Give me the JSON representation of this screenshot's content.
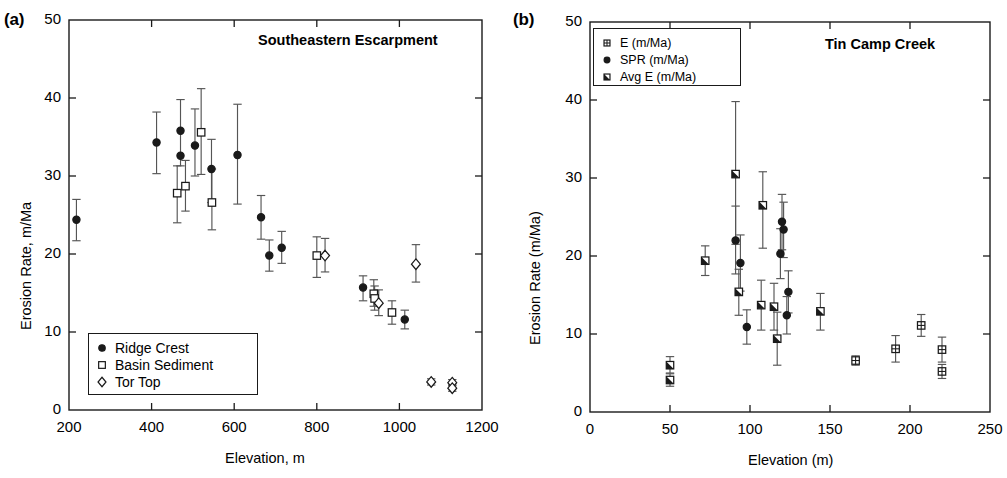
{
  "figure": {
    "background": "#ffffff",
    "ink_color": "#1a1a1a"
  },
  "panels": [
    {
      "id": "a",
      "letter": "(a)",
      "title": "Southeastern Escarpment",
      "xlabel": "Elevation, m",
      "ylabel": "Erosion Rate, m/Ma",
      "xticks": [
        "200",
        "400",
        "600",
        "800",
        "1000",
        "1200"
      ],
      "yticks": [
        "0",
        "10",
        "20",
        "30",
        "40",
        "50"
      ],
      "legend": {
        "items": [
          {
            "label": "Ridge Crest",
            "marker": "filled-circle"
          },
          {
            "label": "Basin Sediment",
            "marker": "open-square"
          },
          {
            "label": "Tor Top",
            "marker": "open-diamond"
          }
        ]
      }
    },
    {
      "id": "b",
      "letter": "(b)",
      "title": "Tin Camp Creek",
      "xlabel": "Elevation (m)",
      "ylabel": "Erosion Rate (m/Ma)",
      "xticks": [
        "0",
        "50",
        "100",
        "150",
        "200",
        "250"
      ],
      "yticks": [
        "0",
        "10",
        "20",
        "30",
        "40",
        "50"
      ],
      "legend": {
        "items": [
          {
            "label": "E (m/Ma)",
            "marker": "crossed-square"
          },
          {
            "label": "SPR (m/Ma)",
            "marker": "filled-circle"
          },
          {
            "label": "Avg E (m/Ma)",
            "marker": "half-filled-square"
          }
        ]
      }
    }
  ],
  "chart_data": [
    {
      "type": "scatter",
      "panel": "a",
      "title": "Southeastern Escarpment",
      "xlabel": "Elevation, m",
      "ylabel": "Erosion Rate, m/Ma",
      "xlim": [
        200,
        1200
      ],
      "ylim": [
        0,
        50
      ],
      "xticks": [
        200,
        400,
        600,
        800,
        1000,
        1200
      ],
      "yticks": [
        0,
        10,
        20,
        30,
        40,
        50
      ],
      "grid": false,
      "errorbars": "vertical",
      "legend_position": "lower-left",
      "series": [
        {
          "name": "Ridge Crest",
          "marker": "filled-circle",
          "points": [
            {
              "x": 218,
              "y": 24.4,
              "yerr_low": 2.7,
              "yerr_high": 2.6
            },
            {
              "x": 412,
              "y": 34.3,
              "yerr_low": 4.0,
              "yerr_high": 3.9
            },
            {
              "x": 470,
              "y": 35.8,
              "yerr_low": 4.5,
              "yerr_high": 4.0
            },
            {
              "x": 470,
              "y": 32.6,
              "yerr_low": 0.0,
              "yerr_high": 0.0
            },
            {
              "x": 505,
              "y": 33.9,
              "yerr_low": 3.9,
              "yerr_high": 4.7
            },
            {
              "x": 545,
              "y": 30.9,
              "yerr_low": 4.3,
              "yerr_high": 3.8
            },
            {
              "x": 608,
              "y": 32.7,
              "yerr_low": 6.3,
              "yerr_high": 6.5
            },
            {
              "x": 665,
              "y": 24.7,
              "yerr_low": 2.8,
              "yerr_high": 2.8
            },
            {
              "x": 685,
              "y": 19.8,
              "yerr_low": 2.0,
              "yerr_high": 2.0
            },
            {
              "x": 715,
              "y": 20.8,
              "yerr_low": 2.0,
              "yerr_high": 2.1
            },
            {
              "x": 912,
              "y": 15.7,
              "yerr_low": 1.7,
              "yerr_high": 1.5
            },
            {
              "x": 1013,
              "y": 11.6,
              "yerr_low": 1.2,
              "yerr_high": 1.2
            }
          ]
        },
        {
          "name": "Basin Sediment",
          "marker": "open-square",
          "points": [
            {
              "x": 462,
              "y": 27.8,
              "yerr_low": 3.8,
              "yerr_high": 3.5
            },
            {
              "x": 482,
              "y": 28.7,
              "yerr_low": 3.2,
              "yerr_high": 3.3
            },
            {
              "x": 520,
              "y": 35.6,
              "yerr_low": 5.4,
              "yerr_high": 5.6
            },
            {
              "x": 546,
              "y": 26.6,
              "yerr_low": 3.5,
              "yerr_high": 4.3
            },
            {
              "x": 800,
              "y": 19.8,
              "yerr_low": 2.8,
              "yerr_high": 2.4
            },
            {
              "x": 938,
              "y": 14.9,
              "yerr_low": 1.6,
              "yerr_high": 1.8
            },
            {
              "x": 940,
              "y": 14.3,
              "yerr_low": 1.5,
              "yerr_high": 1.6
            },
            {
              "x": 982,
              "y": 12.5,
              "yerr_low": 1.5,
              "yerr_high": 1.5
            }
          ]
        },
        {
          "name": "Tor Top",
          "marker": "open-diamond",
          "points": [
            {
              "x": 820,
              "y": 19.8,
              "yerr_low": 2.1,
              "yerr_high": 2.2
            },
            {
              "x": 950,
              "y": 13.7,
              "yerr_low": 1.6,
              "yerr_high": 1.7
            },
            {
              "x": 1040,
              "y": 18.7,
              "yerr_low": 2.3,
              "yerr_high": 2.5
            },
            {
              "x": 1077,
              "y": 3.6,
              "yerr_low": 0.4,
              "yerr_high": 0.4
            },
            {
              "x": 1128,
              "y": 3.5,
              "yerr_low": 0.4,
              "yerr_high": 0.4
            },
            {
              "x": 1128,
              "y": 2.8,
              "yerr_low": 0.4,
              "yerr_high": 0.4
            }
          ]
        }
      ]
    },
    {
      "type": "scatter",
      "panel": "b",
      "title": "Tin Camp Creek",
      "xlabel": "Elevation (m)",
      "ylabel": "Erosion Rate (m/Ma)",
      "xlim": [
        0,
        250
      ],
      "ylim": [
        0,
        50
      ],
      "xticks": [
        0,
        50,
        100,
        150,
        200,
        250
      ],
      "yticks": [
        0,
        10,
        20,
        30,
        40,
        50
      ],
      "grid": false,
      "errorbars": "vertical",
      "legend_position": "upper-left",
      "series": [
        {
          "name": "E (m/Ma)",
          "marker": "crossed-square",
          "points": [
            {
              "x": 166,
              "y": 6.6,
              "yerr_low": 0.6,
              "yerr_high": 0.6
            },
            {
              "x": 191,
              "y": 8.1,
              "yerr_low": 1.7,
              "yerr_high": 1.7
            },
            {
              "x": 207,
              "y": 11.1,
              "yerr_low": 1.4,
              "yerr_high": 1.4
            },
            {
              "x": 220,
              "y": 8.0,
              "yerr_low": 1.6,
              "yerr_high": 1.6
            },
            {
              "x": 220,
              "y": 5.2,
              "yerr_low": 0.9,
              "yerr_high": 0.9
            }
          ]
        },
        {
          "name": "SPR (m/Ma)",
          "marker": "filled-circle",
          "points": [
            {
              "x": 91,
              "y": 22.0,
              "yerr_low": 4.3,
              "yerr_high": 4.4
            },
            {
              "x": 94,
              "y": 19.1,
              "yerr_low": 3.6,
              "yerr_high": 3.6
            },
            {
              "x": 98,
              "y": 10.9,
              "yerr_low": 2.2,
              "yerr_high": 2.2
            },
            {
              "x": 120,
              "y": 24.4,
              "yerr_low": 3.6,
              "yerr_high": 3.5
            },
            {
              "x": 121,
              "y": 23.4,
              "yerr_low": 3.6,
              "yerr_high": 3.5
            },
            {
              "x": 119,
              "y": 20.3,
              "yerr_low": 3.2,
              "yerr_high": 3.2
            },
            {
              "x": 124,
              "y": 15.4,
              "yerr_low": 2.7,
              "yerr_high": 2.7
            },
            {
              "x": 123,
              "y": 12.4,
              "yerr_low": 2.4,
              "yerr_high": 2.4
            }
          ]
        },
        {
          "name": "Avg E (m/Ma)",
          "marker": "half-filled-square",
          "points": [
            {
              "x": 50,
              "y": 6.0,
              "yerr_low": 1.0,
              "yerr_high": 1.1
            },
            {
              "x": 50,
              "y": 4.1,
              "yerr_low": 0.8,
              "yerr_high": 0.8
            },
            {
              "x": 72,
              "y": 19.4,
              "yerr_low": 1.9,
              "yerr_high": 1.9
            },
            {
              "x": 91,
              "y": 30.5,
              "yerr_low": 9.0,
              "yerr_high": 9.3
            },
            {
              "x": 93,
              "y": 15.4,
              "yerr_low": 3.0,
              "yerr_high": 2.9
            },
            {
              "x": 108,
              "y": 26.5,
              "yerr_low": 5.5,
              "yerr_high": 4.3
            },
            {
              "x": 107,
              "y": 13.7,
              "yerr_low": 3.2,
              "yerr_high": 3.2
            },
            {
              "x": 115,
              "y": 13.5,
              "yerr_low": 3.0,
              "yerr_high": 3.0
            },
            {
              "x": 117,
              "y": 9.4,
              "yerr_low": 3.4,
              "yerr_high": 3.4
            },
            {
              "x": 144,
              "y": 12.9,
              "yerr_low": 2.4,
              "yerr_high": 2.3
            }
          ]
        }
      ]
    }
  ]
}
